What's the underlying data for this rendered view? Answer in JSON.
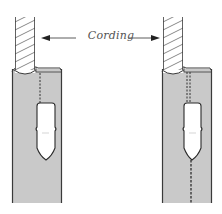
{
  "figure": {
    "label": "Cording",
    "colors": {
      "fabric": "#c9c9c9",
      "outline": "#3a3a3a",
      "rope_fill": "#ffffff",
      "rope_stripe": "#888888",
      "slider_fill": "#ffffff",
      "background": "#ffffff"
    },
    "panels": [
      {
        "name": "left-panel",
        "description": "Cording inserted with single stitching line above zipper slider",
        "stitching": "single-dashed-above-slider"
      },
      {
        "name": "right-panel",
        "description": "Cording with double stitching above slider and dashed line continuing below slider",
        "stitching": "double-dashed-above-single-below"
      }
    ]
  }
}
